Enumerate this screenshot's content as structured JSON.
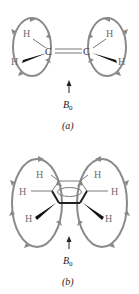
{
  "figure": {
    "panel_a": {
      "label": "(a)",
      "molecule": "ethylene",
      "atoms": {
        "c_left": "C",
        "c_right": "C",
        "h": "H"
      },
      "field_label": "B",
      "field_subscript": "0"
    },
    "panel_b": {
      "label": "(b)",
      "molecule": "benzene",
      "atoms": {
        "h": "H"
      },
      "field_label": "B",
      "field_subscript": "0"
    },
    "colors": {
      "loop": "#8a8a8a",
      "text": "#222222",
      "hydrogen": "#6e6e6e"
    }
  }
}
